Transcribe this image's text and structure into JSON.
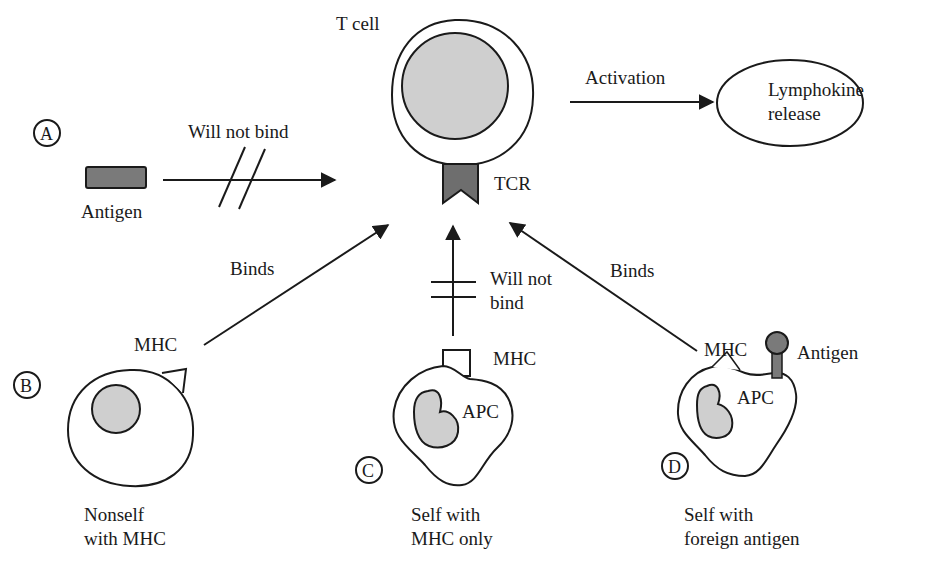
{
  "colors": {
    "line": "#1a1a1a",
    "nucleus_fill": "#cfcfcf",
    "antigen_fill": "#7a7a7a",
    "tcr_fill": "#6e6e6e",
    "background": "#ffffff"
  },
  "tcell": {
    "label": "T cell",
    "receptor_label": "TCR"
  },
  "activation": {
    "arrow_label": "Activation",
    "outcome_line1": "Lymphokine",
    "outcome_line2": "release"
  },
  "panels": [
    {
      "id": "A",
      "marker": "A",
      "item_label": "Antigen",
      "arrow_label": "Will not bind",
      "binds": false
    },
    {
      "id": "B",
      "marker": "B",
      "mhc_label": "MHC",
      "arrow_label": "Binds",
      "caption_line1": "Nonself",
      "caption_line2": "with MHC",
      "binds": true
    },
    {
      "id": "C",
      "marker": "C",
      "mhc_label": "MHC",
      "cell_label": "APC",
      "arrow_label_line1": "Will not",
      "arrow_label_line2": "bind",
      "caption_line1": "Self with",
      "caption_line2": "MHC only",
      "binds": false
    },
    {
      "id": "D",
      "marker": "D",
      "mhc_label": "MHC",
      "antigen_label": "Antigen",
      "cell_label": "APC",
      "arrow_label": "Binds",
      "caption_line1": "Self with",
      "caption_line2": "foreign antigen",
      "binds": true
    }
  ]
}
